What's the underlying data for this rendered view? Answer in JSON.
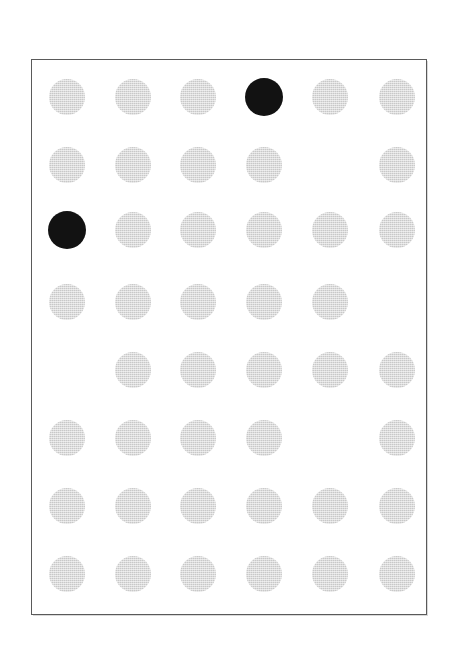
{
  "page": {
    "background_color": "#ffffff",
    "width": 455,
    "height": 653
  },
  "frame": {
    "name": "dot-grid-frame",
    "left": 31,
    "top": 59,
    "width": 396,
    "height": 556,
    "border_width": 1,
    "border_color": "#5a5a5a",
    "fill_color": "#ffffff"
  },
  "grid": {
    "rows": 8,
    "columns": 6,
    "column_centers": [
      66,
      132,
      197,
      263,
      329,
      396
    ],
    "row_centers": [
      96,
      164,
      229,
      301,
      369,
      437,
      505,
      573
    ],
    "default_radius": 18,
    "emphasis_radius": 19,
    "colors": {
      "dot_gray": "#c8c8c8",
      "dot_black": "#121212"
    },
    "legend": {
      "gray_label": "unmarked dot",
      "black_label": "marked dot",
      "empty_label": "empty cell"
    },
    "counts": {
      "total_cells": 48,
      "gray_dots": 42,
      "black_dots": 2,
      "empty_cells": 4
    },
    "cells": [
      {
        "row": 1,
        "col": 1,
        "state": "gray"
      },
      {
        "row": 1,
        "col": 2,
        "state": "gray"
      },
      {
        "row": 1,
        "col": 3,
        "state": "gray"
      },
      {
        "row": 1,
        "col": 4,
        "state": "black"
      },
      {
        "row": 1,
        "col": 5,
        "state": "gray"
      },
      {
        "row": 1,
        "col": 6,
        "state": "gray"
      },
      {
        "row": 2,
        "col": 1,
        "state": "gray"
      },
      {
        "row": 2,
        "col": 2,
        "state": "gray"
      },
      {
        "row": 2,
        "col": 3,
        "state": "gray"
      },
      {
        "row": 2,
        "col": 4,
        "state": "gray"
      },
      {
        "row": 2,
        "col": 5,
        "state": "empty"
      },
      {
        "row": 2,
        "col": 6,
        "state": "gray"
      },
      {
        "row": 3,
        "col": 1,
        "state": "black"
      },
      {
        "row": 3,
        "col": 2,
        "state": "gray"
      },
      {
        "row": 3,
        "col": 3,
        "state": "gray"
      },
      {
        "row": 3,
        "col": 4,
        "state": "gray"
      },
      {
        "row": 3,
        "col": 5,
        "state": "gray"
      },
      {
        "row": 3,
        "col": 6,
        "state": "gray"
      },
      {
        "row": 4,
        "col": 1,
        "state": "gray"
      },
      {
        "row": 4,
        "col": 2,
        "state": "gray"
      },
      {
        "row": 4,
        "col": 3,
        "state": "gray"
      },
      {
        "row": 4,
        "col": 4,
        "state": "gray"
      },
      {
        "row": 4,
        "col": 5,
        "state": "gray"
      },
      {
        "row": 4,
        "col": 6,
        "state": "empty"
      },
      {
        "row": 5,
        "col": 1,
        "state": "empty"
      },
      {
        "row": 5,
        "col": 2,
        "state": "gray"
      },
      {
        "row": 5,
        "col": 3,
        "state": "gray"
      },
      {
        "row": 5,
        "col": 4,
        "state": "gray"
      },
      {
        "row": 5,
        "col": 5,
        "state": "gray"
      },
      {
        "row": 5,
        "col": 6,
        "state": "gray"
      },
      {
        "row": 6,
        "col": 1,
        "state": "gray"
      },
      {
        "row": 6,
        "col": 2,
        "state": "gray"
      },
      {
        "row": 6,
        "col": 3,
        "state": "gray"
      },
      {
        "row": 6,
        "col": 4,
        "state": "gray"
      },
      {
        "row": 6,
        "col": 5,
        "state": "empty"
      },
      {
        "row": 6,
        "col": 6,
        "state": "gray"
      },
      {
        "row": 7,
        "col": 1,
        "state": "gray"
      },
      {
        "row": 7,
        "col": 2,
        "state": "gray"
      },
      {
        "row": 7,
        "col": 3,
        "state": "gray"
      },
      {
        "row": 7,
        "col": 4,
        "state": "gray"
      },
      {
        "row": 7,
        "col": 5,
        "state": "gray"
      },
      {
        "row": 7,
        "col": 6,
        "state": "gray"
      },
      {
        "row": 8,
        "col": 1,
        "state": "gray"
      },
      {
        "row": 8,
        "col": 2,
        "state": "gray"
      },
      {
        "row": 8,
        "col": 3,
        "state": "gray"
      },
      {
        "row": 8,
        "col": 4,
        "state": "gray"
      },
      {
        "row": 8,
        "col": 5,
        "state": "gray"
      },
      {
        "row": 8,
        "col": 6,
        "state": "gray"
      }
    ]
  }
}
